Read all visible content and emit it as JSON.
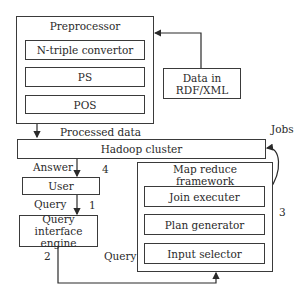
{
  "diagram": {
    "preprocessor": {
      "title": "Preprocessor",
      "steps": [
        "N-triple convertor",
        "PS",
        "POS"
      ]
    },
    "data_source": {
      "line1": "Data in",
      "line2": "RDF/XML"
    },
    "hadoop": {
      "label": "Hadoop cluster"
    },
    "user": {
      "label": "User"
    },
    "query_engine": {
      "line1": "Query interface",
      "line2": "engine"
    },
    "map_reduce": {
      "title_line1": "Map reduce",
      "title_line2": "framework",
      "components": [
        "Join executer",
        "Plan generator",
        "Input selector"
      ]
    },
    "edge_labels": {
      "processed_data": "Processed data",
      "jobs": "Jobs",
      "answer": "Answer",
      "query_user": "Query",
      "query_mr": "Query",
      "step1": "1",
      "step2": "2",
      "step3": "3",
      "step4": "4"
    }
  }
}
